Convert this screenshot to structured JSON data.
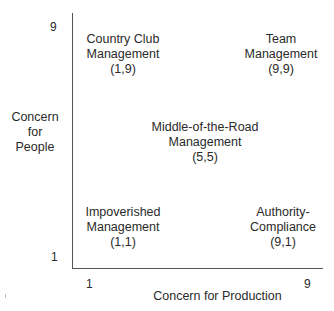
{
  "grid": {
    "y_axis": {
      "label_lines": [
        "Concern",
        "for",
        "People"
      ],
      "tick_max": "9",
      "tick_min": "1"
    },
    "x_axis": {
      "label": "Concern for Production",
      "tick_min": "1",
      "tick_max": "9"
    },
    "styles": [
      {
        "lines": [
          "Country Club",
          "Management",
          "(1,9)"
        ]
      },
      {
        "lines": [
          "Team",
          "Management",
          "(9,9)"
        ]
      },
      {
        "lines": [
          "Middle-of-the-Road",
          "Management",
          "(5,5)"
        ]
      },
      {
        "lines": [
          "Impoverished",
          "Management",
          "(1,1)"
        ]
      },
      {
        "lines": [
          "Authority-",
          "Compliance",
          "(9,1)"
        ]
      }
    ]
  }
}
